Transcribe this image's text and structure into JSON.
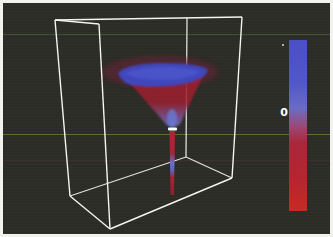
{
  "scene": {
    "description": "3D vortex/tornado funnel visualization inside wireframe bounding box",
    "background_color": "#2c2d26",
    "box_color": "#f4f4f0",
    "colors": {
      "positive": "#4a52c8",
      "negative": "#b8262a",
      "neck_marker": "#ffffff"
    }
  },
  "colorbar": {
    "zero_label": "0",
    "top_color": "#4b4fc4",
    "mid_color": "#8a6fb5",
    "bottom_color": "#c62a24"
  }
}
